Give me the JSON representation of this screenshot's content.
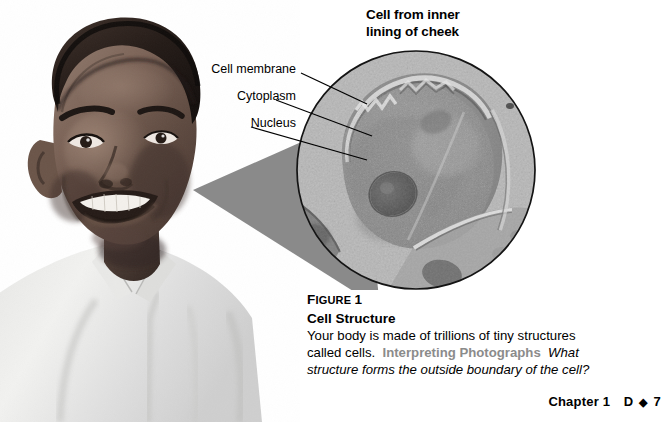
{
  "figure": {
    "heading_line1": "Cell from inner",
    "heading_line2": "lining of cheek",
    "photo_alt": "student-portrait-photo",
    "micrograph_alt": "cheek-cell-micrograph"
  },
  "callouts": [
    {
      "id": "cell-membrane",
      "label": "Cell membrane"
    },
    {
      "id": "cytoplasm",
      "label": "Cytoplasm"
    },
    {
      "id": "nucleus",
      "label": "Nucleus"
    }
  ],
  "caption": {
    "figure_word": "F",
    "figure_word_rest": "IGURE",
    "figure_number": "1",
    "title": "Cell Structure",
    "body_line1": "Your body is made of trillions of tiny structures",
    "body_line2_start": "called cells.",
    "lead_in": "Interpreting Photographs",
    "question_line2": "What",
    "question_line3": "structure forms the outside boundary of the cell?"
  },
  "footer": {
    "chapter": "Chapter 1",
    "unit": "D",
    "diamond": "◆",
    "page": "7"
  },
  "colors": {
    "text": "#000000",
    "lead_in_gray": "#8b8b8b",
    "cone_gray": "#8a8a8a",
    "circle_outline": "#1a1a1a",
    "background": "#ffffff"
  }
}
